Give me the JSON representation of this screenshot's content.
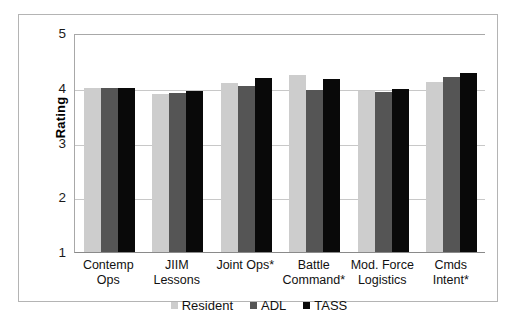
{
  "chart_data": {
    "type": "bar",
    "title": "",
    "xlabel": "",
    "ylabel": "Rating",
    "ylim": [
      1,
      5
    ],
    "yticks": [
      1,
      2,
      3,
      4,
      5
    ],
    "ytick_labels": [
      "1",
      "2",
      "3",
      "4",
      "5"
    ],
    "grid": true,
    "legend_position": "bottom",
    "categories": [
      "Contemp Ops",
      "JIIM Lessons",
      "Joint Ops*",
      "Battle Command*",
      "Mod. Force Logistics",
      "Cmds Intent*"
    ],
    "category_lines": [
      [
        "Contemp",
        "Ops"
      ],
      [
        "JIIM",
        "Lessons"
      ],
      [
        "Joint Ops*",
        ""
      ],
      [
        "Battle",
        "Command*"
      ],
      [
        "Mod. Force",
        "Logistics"
      ],
      [
        "Cmds",
        "Intent*"
      ]
    ],
    "series": [
      {
        "name": "Resident",
        "color": "#cdcdcd",
        "values": [
          4.0,
          3.88,
          4.08,
          4.23,
          3.94,
          4.11
        ]
      },
      {
        "name": "ADL",
        "color": "#555555",
        "values": [
          3.99,
          3.9,
          4.04,
          3.96,
          3.92,
          4.19
        ]
      },
      {
        "name": "TASS",
        "color": "#090909",
        "values": [
          4.0,
          3.95,
          4.18,
          4.16,
          3.97,
          4.27
        ]
      }
    ]
  },
  "legend": {
    "items": [
      {
        "label": "Resident",
        "color": "#cdcdcd"
      },
      {
        "label": "ADL",
        "color": "#555555"
      },
      {
        "label": "TASS",
        "color": "#090909"
      }
    ]
  }
}
